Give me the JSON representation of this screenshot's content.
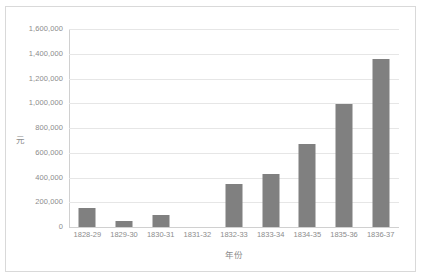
{
  "chart_data": {
    "type": "bar",
    "title": "",
    "xlabel": "年份",
    "ylabel": "元",
    "categories": [
      "1828-29",
      "1829-30",
      "1830-31",
      "1831-32",
      "1832-33",
      "1833-34",
      "1834-35",
      "1835-36",
      "1836-37"
    ],
    "values": [
      150000,
      50000,
      95000,
      0,
      345000,
      430000,
      670000,
      995000,
      1360000
    ],
    "ylim": [
      0,
      1600000
    ],
    "ytick_labels": [
      "1,600,000",
      "1,400,000",
      "1,200,000",
      "1,000,000",
      "800,000",
      "600,000",
      "400,000",
      "200,000",
      "0"
    ],
    "ytick_values": [
      1600000,
      1400000,
      1200000,
      1000000,
      800000,
      600000,
      400000,
      200000,
      0
    ],
    "grid": "horizontal",
    "legend": "none",
    "bar_color": "#808080",
    "gridline_color": "#e6e6e6",
    "axis_text_color": "#8c8c8c",
    "border_color": "#d9d9d9"
  }
}
